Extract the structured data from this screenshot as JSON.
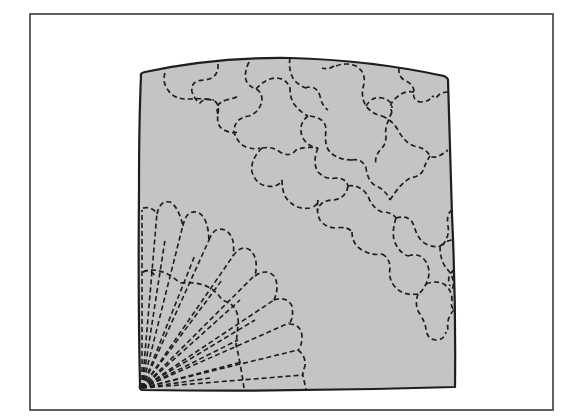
{
  "figure": {
    "colors": {
      "background": "#ffffff",
      "frame": "#3a3a3a",
      "fabric_fill": "#c4c4c4",
      "stitch": "#1e1e1e"
    },
    "frame": {
      "x": 30,
      "y": 14,
      "width": 523,
      "height": 396
    },
    "fabric": {
      "corners": {
        "top_left": [
          140,
          75
        ],
        "top_right": [
          448,
          78
        ],
        "bottom_right": [
          455,
          388
        ],
        "bottom_left": [
          140,
          390
        ]
      },
      "top_edge_peak": [
        290,
        58
      ]
    },
    "fan": {
      "origin": [
        142,
        388
      ],
      "blade_count": 7,
      "inner_arc_radius": 90,
      "outer_arc_radius": 250
    },
    "puzzle_motifs": {
      "count_approx": 10,
      "region": "upper-right"
    }
  }
}
